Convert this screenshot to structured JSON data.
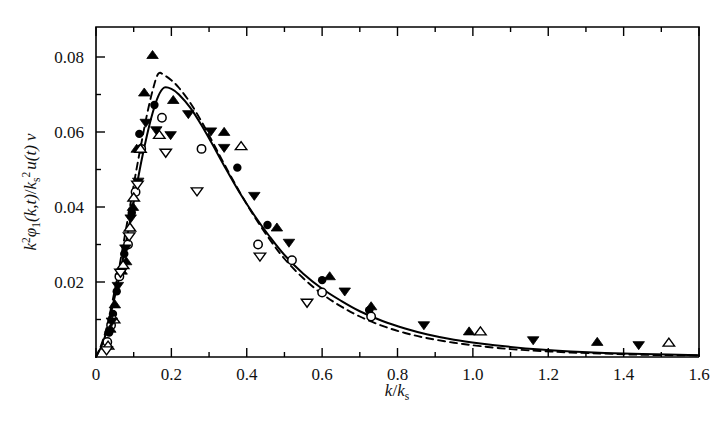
{
  "chart_data": {
    "type": "scatter",
    "title": "",
    "xlabel": "k/k_s",
    "ylabel": "k^2 phi_1(k,t) / k_s^2 u(t) nu",
    "xlim": [
      0,
      1.6
    ],
    "ylim": [
      0,
      0.088
    ],
    "grid": false,
    "legend": "none",
    "x_ticks": [
      0,
      0.2,
      0.4,
      0.6,
      0.8,
      1.0,
      1.2,
      1.4,
      1.6
    ],
    "x_tick_labels": [
      "0",
      "0.2",
      "0.4",
      "0.6",
      "0.8",
      "1.0",
      "1.2",
      "1.4",
      "1.6"
    ],
    "x_minor_step": 0.1,
    "y_ticks": [
      0.02,
      0.04,
      0.06,
      0.08
    ],
    "y_tick_labels": [
      "0.02",
      "0.04",
      "0.06",
      "0.08"
    ],
    "y_minor_step": 0.01,
    "series": [
      {
        "name": "filled-circle",
        "marker": "filled-circle",
        "points": [
          [
            0.035,
            0.0065
          ],
          [
            0.045,
            0.0115
          ],
          [
            0.055,
            0.0175
          ],
          [
            0.075,
            0.0275
          ],
          [
            0.095,
            0.0385
          ],
          [
            0.115,
            0.0595
          ],
          [
            0.155,
            0.0672
          ],
          [
            0.375,
            0.0505
          ],
          [
            0.455,
            0.0352
          ],
          [
            0.6,
            0.0205
          ],
          [
            0.725,
            0.0125
          ]
        ]
      },
      {
        "name": "open-circle",
        "marker": "open-circle",
        "points": [
          [
            0.03,
            0.004
          ],
          [
            0.04,
            0.0085
          ],
          [
            0.062,
            0.0215
          ],
          [
            0.085,
            0.03
          ],
          [
            0.105,
            0.044
          ],
          [
            0.12,
            0.0555
          ],
          [
            0.175,
            0.0638
          ],
          [
            0.28,
            0.0555
          ],
          [
            0.43,
            0.03
          ],
          [
            0.52,
            0.0258
          ],
          [
            0.6,
            0.0172
          ],
          [
            0.73,
            0.0108
          ]
        ]
      },
      {
        "name": "filled-triangle-up",
        "marker": "filled-triangle-up",
        "points": [
          [
            0.038,
            0.0075
          ],
          [
            0.05,
            0.014
          ],
          [
            0.068,
            0.023
          ],
          [
            0.08,
            0.0255
          ],
          [
            0.098,
            0.04
          ],
          [
            0.108,
            0.0555
          ],
          [
            0.128,
            0.0705
          ],
          [
            0.15,
            0.0805
          ],
          [
            0.205,
            0.0685
          ],
          [
            0.34,
            0.06
          ],
          [
            0.48,
            0.0345
          ],
          [
            0.62,
            0.0215
          ],
          [
            0.73,
            0.0135
          ],
          [
            0.99,
            0.0068
          ],
          [
            1.33,
            0.004
          ]
        ]
      },
      {
        "name": "open-triangle-up",
        "marker": "open-triangle-up",
        "points": [
          [
            0.032,
            0.003
          ],
          [
            0.048,
            0.01
          ],
          [
            0.072,
            0.0245
          ],
          [
            0.09,
            0.0345
          ],
          [
            0.1,
            0.0425
          ],
          [
            0.118,
            0.0555
          ],
          [
            0.168,
            0.0592
          ],
          [
            0.385,
            0.0562
          ],
          [
            1.02,
            0.0068
          ],
          [
            1.52,
            0.0038
          ]
        ]
      },
      {
        "name": "filled-triangle-down",
        "marker": "filled-triangle-down",
        "points": [
          [
            0.042,
            0.0095
          ],
          [
            0.058,
            0.019
          ],
          [
            0.078,
            0.029
          ],
          [
            0.092,
            0.037
          ],
          [
            0.112,
            0.0468
          ],
          [
            0.132,
            0.0625
          ],
          [
            0.16,
            0.0605
          ],
          [
            0.198,
            0.0592
          ],
          [
            0.245,
            0.0648
          ],
          [
            0.305,
            0.0602
          ],
          [
            0.34,
            0.0558
          ],
          [
            0.42,
            0.043
          ],
          [
            0.512,
            0.0305
          ],
          [
            0.66,
            0.0175
          ],
          [
            0.87,
            0.0085
          ],
          [
            1.16,
            0.0045
          ],
          [
            1.44,
            0.0032
          ]
        ]
      },
      {
        "name": "open-triangle-down",
        "marker": "open-triangle-down",
        "points": [
          [
            0.028,
            0.0018
          ],
          [
            0.065,
            0.0225
          ],
          [
            0.088,
            0.0322
          ],
          [
            0.11,
            0.046
          ],
          [
            0.185,
            0.0545
          ],
          [
            0.268,
            0.0442
          ],
          [
            0.435,
            0.0268
          ],
          [
            0.56,
            0.0145
          ]
        ]
      }
    ],
    "curves": [
      {
        "name": "solid-model-curve",
        "style": "solid",
        "peak_x": 0.18,
        "peak_y": 0.0718,
        "points": [
          [
            0.0,
            0.0
          ],
          [
            0.015,
            0.003
          ],
          [
            0.03,
            0.0075
          ],
          [
            0.045,
            0.014
          ],
          [
            0.06,
            0.0205
          ],
          [
            0.075,
            0.028
          ],
          [
            0.09,
            0.036
          ],
          [
            0.105,
            0.044
          ],
          [
            0.12,
            0.052
          ],
          [
            0.135,
            0.059
          ],
          [
            0.15,
            0.065
          ],
          [
            0.165,
            0.0695
          ],
          [
            0.18,
            0.0718
          ],
          [
            0.2,
            0.0715
          ],
          [
            0.22,
            0.07
          ],
          [
            0.25,
            0.0665
          ],
          [
            0.28,
            0.0618
          ],
          [
            0.31,
            0.0565
          ],
          [
            0.34,
            0.051
          ],
          [
            0.38,
            0.044
          ],
          [
            0.42,
            0.0378
          ],
          [
            0.46,
            0.0322
          ],
          [
            0.5,
            0.0272
          ],
          [
            0.55,
            0.0222
          ],
          [
            0.6,
            0.0182
          ],
          [
            0.65,
            0.015
          ],
          [
            0.7,
            0.0122
          ],
          [
            0.76,
            0.0096
          ],
          [
            0.82,
            0.0076
          ],
          [
            0.88,
            0.006
          ],
          [
            0.95,
            0.0046
          ],
          [
            1.02,
            0.0036
          ],
          [
            1.1,
            0.0027
          ],
          [
            1.18,
            0.002
          ],
          [
            1.26,
            0.0015
          ],
          [
            1.35,
            0.0011
          ],
          [
            1.45,
            0.0008
          ],
          [
            1.6,
            0.0005
          ]
        ]
      },
      {
        "name": "dashed-model-curve",
        "style": "dashed",
        "peak_x": 0.165,
        "peak_y": 0.0755,
        "points": [
          [
            0.0,
            0.0
          ],
          [
            0.015,
            0.0035
          ],
          [
            0.03,
            0.0085
          ],
          [
            0.045,
            0.0155
          ],
          [
            0.06,
            0.023
          ],
          [
            0.075,
            0.0315
          ],
          [
            0.09,
            0.04
          ],
          [
            0.105,
            0.0487
          ],
          [
            0.12,
            0.0568
          ],
          [
            0.135,
            0.0645
          ],
          [
            0.15,
            0.071
          ],
          [
            0.165,
            0.0755
          ],
          [
            0.18,
            0.0752
          ],
          [
            0.2,
            0.0738
          ],
          [
            0.22,
            0.0718
          ],
          [
            0.25,
            0.0678
          ],
          [
            0.28,
            0.0628
          ],
          [
            0.31,
            0.0572
          ],
          [
            0.34,
            0.0515
          ],
          [
            0.38,
            0.0442
          ],
          [
            0.42,
            0.0375
          ],
          [
            0.46,
            0.0315
          ],
          [
            0.5,
            0.0262
          ],
          [
            0.55,
            0.021
          ],
          [
            0.6,
            0.0168
          ],
          [
            0.65,
            0.0135
          ],
          [
            0.7,
            0.0108
          ],
          [
            0.76,
            0.0083
          ],
          [
            0.82,
            0.0064
          ],
          [
            0.88,
            0.005
          ],
          [
            0.95,
            0.0038
          ],
          [
            1.02,
            0.0029
          ],
          [
            1.1,
            0.0021
          ],
          [
            1.18,
            0.0016
          ],
          [
            1.26,
            0.0012
          ],
          [
            1.35,
            0.0009
          ],
          [
            1.45,
            0.0006
          ],
          [
            1.6,
            0.0004
          ]
        ]
      }
    ]
  },
  "axes": {
    "ylabel_parts": {
      "k1": "k",
      "k1_sup": "2",
      "phi": "φ",
      "phi_sub": "1",
      "arg": "(k,t)",
      "slash": "/",
      "k2": "k",
      "k2_sub": "s",
      "k2_sup": "2",
      "u": "u",
      "ut": "(t)",
      "nu": "ν"
    },
    "xlabel_parts": {
      "k": "k",
      "slash": "/",
      "ks": "k",
      "ks_sub": "s"
    }
  }
}
